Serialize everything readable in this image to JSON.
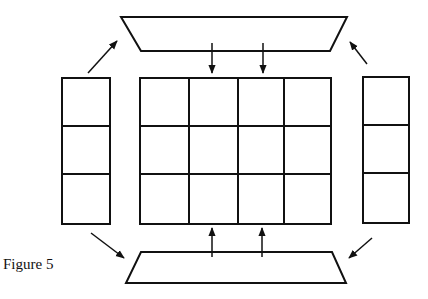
{
  "figure": {
    "caption": "Figure 5",
    "stroke_color": "#111111",
    "background": "#ffffff"
  },
  "top_trapezoid": {
    "points": "121,17 347,17 330,51 141,51"
  },
  "bottom_trapezoid": {
    "points": "141,252 332,252 346,283 126,283"
  },
  "center_grid": {
    "x": 140,
    "y": 78,
    "width": 191,
    "height": 146,
    "rows": 3,
    "cols": 4,
    "col_lines": [
      189,
      238,
      284
    ],
    "row_lines": [
      126,
      174
    ]
  },
  "left_panel": {
    "x": 62,
    "y": 78,
    "width": 48,
    "height": 146,
    "rows": 3,
    "row_lines": [
      126,
      174
    ]
  },
  "right_panel": {
    "x": 363,
    "y": 77,
    "width": 46,
    "height": 146,
    "rows": 3,
    "row_lines": [
      125,
      173
    ]
  },
  "arrows": [
    {
      "name": "arrow-top-down-1",
      "x1": 212,
      "y1": 43,
      "x2": 212,
      "y2": 73
    },
    {
      "name": "arrow-top-down-2",
      "x1": 263,
      "y1": 43,
      "x2": 263,
      "y2": 73
    },
    {
      "name": "arrow-bottom-up-1",
      "x1": 212,
      "y1": 257,
      "x2": 212,
      "y2": 228
    },
    {
      "name": "arrow-bottom-up-2",
      "x1": 262,
      "y1": 257,
      "x2": 262,
      "y2": 228
    },
    {
      "name": "arrow-left-to-top",
      "x1": 88,
      "y1": 73,
      "x2": 117,
      "y2": 41
    },
    {
      "name": "arrow-right-to-top",
      "x1": 367,
      "y1": 64,
      "x2": 350,
      "y2": 42
    },
    {
      "name": "arrow-left-to-bottom",
      "x1": 91,
      "y1": 233,
      "x2": 124,
      "y2": 258
    },
    {
      "name": "arrow-right-to-bottom",
      "x1": 372,
      "y1": 238,
      "x2": 349,
      "y2": 258
    }
  ]
}
